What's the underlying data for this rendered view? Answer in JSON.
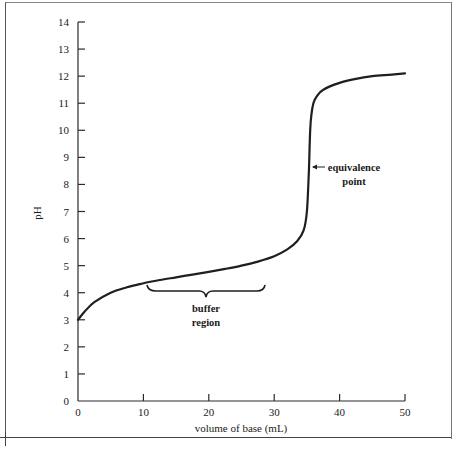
{
  "chart_data": {
    "type": "line",
    "title": "",
    "xlabel": "volume of base (mL)",
    "ylabel": "pH",
    "xlim": [
      0,
      50
    ],
    "ylim": [
      0,
      14
    ],
    "grid": false,
    "legend": null,
    "x_ticks": [
      0,
      10,
      20,
      30,
      40,
      50
    ],
    "y_ticks": [
      0,
      1,
      2,
      3,
      4,
      5,
      6,
      7,
      8,
      9,
      10,
      11,
      12,
      13,
      14
    ],
    "series": [
      {
        "name": "titration curve",
        "x": [
          0,
          1,
          2.5,
          5,
          7.5,
          10,
          12.5,
          15,
          17.5,
          20,
          22.5,
          25,
          27.5,
          30,
          32,
          33.5,
          34.5,
          35,
          35.3,
          35.5,
          35.7,
          36,
          36.5,
          37.5,
          40,
          42.5,
          45,
          47.5,
          50
        ],
        "y": [
          3.0,
          3.3,
          3.65,
          4.0,
          4.2,
          4.35,
          4.47,
          4.57,
          4.67,
          4.77,
          4.88,
          5.0,
          5.15,
          5.35,
          5.6,
          5.9,
          6.3,
          7.0,
          8.5,
          10.0,
          10.6,
          11.0,
          11.25,
          11.5,
          11.75,
          11.9,
          12.0,
          12.05,
          12.1
        ]
      }
    ],
    "annotations": [
      {
        "text": "equivalence point",
        "x": 35.3,
        "y": 8.5,
        "arrow": true
      },
      {
        "text": "buffer region",
        "x_range": [
          10,
          28
        ],
        "y": 4.1,
        "type": "brace"
      }
    ]
  },
  "axis": {
    "x_tick_labels": [
      "0",
      "10",
      "20",
      "30",
      "40",
      "50"
    ],
    "y_tick_labels": [
      "0",
      "1",
      "2",
      "3",
      "4",
      "5",
      "6",
      "7",
      "8",
      "9",
      "10",
      "11",
      "12",
      "13",
      "14"
    ],
    "x_title": "volume of base (mL)",
    "y_title": "pH"
  },
  "annotations": {
    "equivalence_line1": "equivalence",
    "equivalence_line2": "point",
    "buffer_line1": "buffer",
    "buffer_line2": "region"
  }
}
